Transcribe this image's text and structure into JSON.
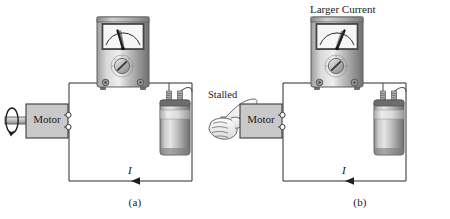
{
  "figure": {
    "title_hidden": "",
    "panels": [
      {
        "id": "a",
        "caption": "(a)",
        "motor_label": "Motor",
        "current_label": "I",
        "state": "running",
        "shaft_note": "rotating shaft with circular rotation arrow",
        "meter": {
          "name": "analog-ammeter",
          "needle_reading_fraction": 0.36,
          "needle_angle_deg": -20,
          "dial_label": "selector-knob"
        },
        "battery": {
          "name": "lantern-battery",
          "terminals": 2
        },
        "top_label": ""
      },
      {
        "id": "b",
        "caption": "(b)",
        "motor_label": "Motor",
        "current_label": "I",
        "state": "stalled",
        "stalled_label": "Stalled",
        "shaft_note": "hand gripping shaft to stall the motor",
        "meter": {
          "name": "analog-ammeter",
          "needle_reading_fraction": 0.68,
          "needle_angle_deg": 22,
          "dial_label": "selector-knob"
        },
        "battery": {
          "name": "lantern-battery",
          "terminals": 2
        },
        "top_label": "Larger Current"
      }
    ]
  },
  "colors": {
    "background": "#ffffff",
    "line": "#2b2b2b",
    "motor_fill": "#c9c9c9",
    "motor_stroke": "#3a3a3a",
    "meter_body_light": "#e3e3e3",
    "meter_body_mid": "#b4b4b4",
    "meter_body_dark": "#8d8d8d",
    "meter_face": "#f4f4f4",
    "battery_light": "#d6d6d6",
    "battery_mid": "#a9a9a9",
    "battery_dark": "#7d7d7d",
    "text": "#1a1a1a"
  },
  "icons": {
    "rotation_arrow": "rotation-arrow-icon",
    "current_arrow": "current-arrow-icon",
    "hand": "hand-grip-icon",
    "needle": "meter-needle-icon",
    "knob": "selector-knob-icon",
    "spring_terminal": "spring-terminal-icon"
  }
}
